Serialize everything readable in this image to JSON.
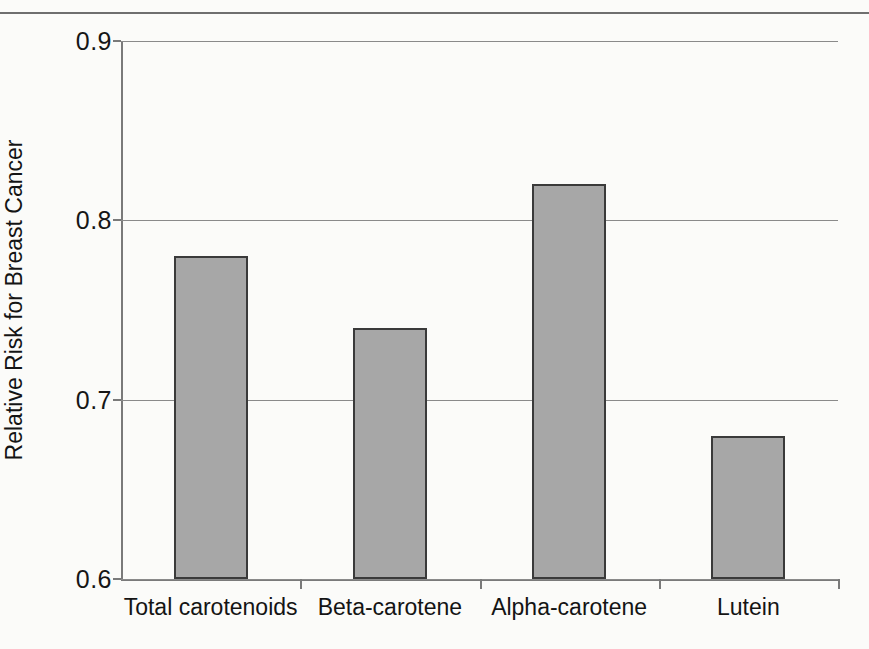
{
  "figure": {
    "background_color": "#fbfbf9",
    "has_top_rule": true
  },
  "chart_data": {
    "type": "bar",
    "title": "",
    "xlabel": "",
    "ylabel": "Relative Risk for Breast Cancer",
    "categories": [
      "Total carotenoids",
      "Beta-carotene",
      "Alpha-carotene",
      "Lutein"
    ],
    "values": [
      0.78,
      0.74,
      0.82,
      0.68
    ],
    "ylim": [
      0.6,
      0.9
    ],
    "yticks": [
      0.6,
      0.7,
      0.8,
      0.9
    ],
    "ytick_labels": [
      "0.6",
      "0.7",
      "0.8",
      "0.9"
    ],
    "grid": true,
    "grid_axis": "y",
    "legend": null,
    "bar_fill_color": "#a7a7a7",
    "bar_edge_color": "#3a3a3a",
    "axis_color": "#7a7a7a",
    "gridline_color": "#8a8a8a"
  }
}
